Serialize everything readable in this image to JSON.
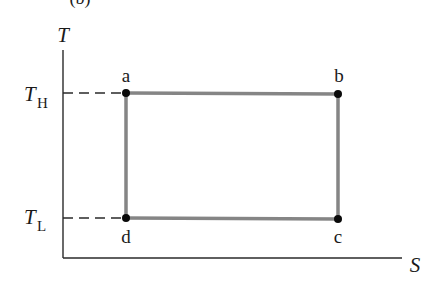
{
  "figure": {
    "panel_label": "(b)",
    "diagram_type": "Carnot cycle on T-S diagram",
    "axes": {
      "y_label": "T",
      "x_label": "S"
    },
    "levels": {
      "high": {
        "symbol": "T",
        "subscript": "H"
      },
      "low": {
        "symbol": "T",
        "subscript": "L"
      }
    },
    "points": [
      {
        "label": "a",
        "level": "high",
        "side": "left"
      },
      {
        "label": "b",
        "level": "high",
        "side": "right"
      },
      {
        "label": "c",
        "level": "low",
        "side": "right"
      },
      {
        "label": "d",
        "level": "low",
        "side": "left"
      }
    ],
    "colors": {
      "cycle_line": "#858585",
      "axis": "#2a2a2a",
      "points": "#0a0a0a"
    }
  }
}
